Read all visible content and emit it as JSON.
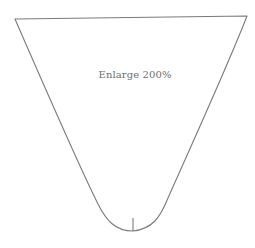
{
  "pattern": {
    "instruction": "Enlarge 200%",
    "shape": "pattern-piece-outline",
    "colors": {
      "line": "#7a7a7a",
      "text": "#6e6e6e",
      "background": "#ffffff"
    },
    "outline_path": "M15,19 L247,16 C230,60 205,115 168,198 C160,218 152,229 133,231 C115,231 106,220 98,204 C80,168 45,88 15,19 Z",
    "notch_path": "M133,218 L133,231"
  }
}
